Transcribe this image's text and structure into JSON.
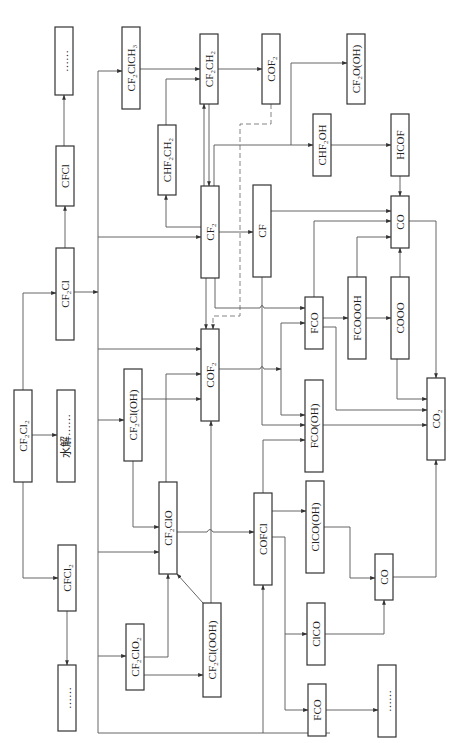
{
  "diagram": {
    "orientation": "rotated-90-ccw",
    "nodes": [
      {
        "id": "CF2Cl2",
        "label": "CF₂Cl₂",
        "x": 14,
        "y": 390,
        "w": 18,
        "h": 92
      },
      {
        "id": "hydrolysis",
        "label": "水解……",
        "x": 57,
        "y": 390,
        "w": 18,
        "h": 92
      },
      {
        "id": "CF2Cl",
        "label": "CF₂Cl",
        "x": 56,
        "y": 248,
        "w": 18,
        "h": 92
      },
      {
        "id": "CFCl",
        "label": "CFCl",
        "x": 56,
        "y": 146,
        "w": 18,
        "h": 60
      },
      {
        "id": "dots1",
        "label": "……",
        "x": 55,
        "y": 27,
        "w": 18,
        "h": 68
      },
      {
        "id": "CFCl2",
        "label": "CFCl₂",
        "x": 58,
        "y": 545,
        "w": 18,
        "h": 66
      },
      {
        "id": "dots2",
        "label": "……",
        "x": 58,
        "y": 665,
        "w": 18,
        "h": 66
      },
      {
        "id": "CF2ClCH3",
        "label": "CF₂ClCH₃",
        "x": 122,
        "y": 27,
        "w": 18,
        "h": 82
      },
      {
        "id": "CHF2CH2",
        "label": "CHF₂CH₂",
        "x": 158,
        "y": 125,
        "w": 18,
        "h": 70
      },
      {
        "id": "CF2CH2",
        "label": "CF₂CH₂",
        "x": 200,
        "y": 34,
        "w": 18,
        "h": 70
      },
      {
        "id": "COF2_top",
        "label": "COF₂",
        "x": 262,
        "y": 34,
        "w": 18,
        "h": 70
      },
      {
        "id": "CF2OOH",
        "label": "CF₂O(OH)",
        "x": 347,
        "y": 34,
        "w": 18,
        "h": 70
      },
      {
        "id": "CHF2OH",
        "label": "CHF₂OH",
        "x": 313,
        "y": 114,
        "w": 18,
        "h": 62
      },
      {
        "id": "HCOF",
        "label": "HCOF",
        "x": 391,
        "y": 114,
        "w": 18,
        "h": 62
      },
      {
        "id": "CF2",
        "label": "CF₂",
        "x": 201,
        "y": 186,
        "w": 18,
        "h": 92
      },
      {
        "id": "CF",
        "label": "CF",
        "x": 253,
        "y": 185,
        "w": 18,
        "h": 92
      },
      {
        "id": "CO_top",
        "label": "CO",
        "x": 391,
        "y": 196,
        "w": 18,
        "h": 52
      },
      {
        "id": "COF2",
        "label": "COF₂",
        "x": 201,
        "y": 329,
        "w": 18,
        "h": 92
      },
      {
        "id": "FCO",
        "label": "FCO",
        "x": 305,
        "y": 297,
        "w": 18,
        "h": 52
      },
      {
        "id": "FCOOOH",
        "label": "FCOOOH",
        "x": 348,
        "y": 277,
        "w": 18,
        "h": 82
      },
      {
        "id": "COOO",
        "label": "COOO",
        "x": 391,
        "y": 277,
        "w": 18,
        "h": 82
      },
      {
        "id": "FCOOH",
        "label": "FCO(OH)",
        "x": 305,
        "y": 380,
        "w": 18,
        "h": 92
      },
      {
        "id": "CO2",
        "label": "CO₂",
        "x": 427,
        "y": 378,
        "w": 18,
        "h": 82
      },
      {
        "id": "CF2ClOH",
        "label": "CF₂Cl(OH)",
        "x": 124,
        "y": 369,
        "w": 18,
        "h": 92
      },
      {
        "id": "CF2ClO",
        "label": "CF₂ClO",
        "x": 159,
        "y": 482,
        "w": 18,
        "h": 92
      },
      {
        "id": "COFCl",
        "label": "COFCl",
        "x": 254,
        "y": 493,
        "w": 18,
        "h": 92
      },
      {
        "id": "ClCOOH",
        "label": "ClCO(OH)",
        "x": 306,
        "y": 481,
        "w": 18,
        "h": 92
      },
      {
        "id": "CO_bot",
        "label": "CO",
        "x": 375,
        "y": 554,
        "w": 18,
        "h": 46
      },
      {
        "id": "ClCO",
        "label": "ClCO",
        "x": 307,
        "y": 603,
        "w": 18,
        "h": 62
      },
      {
        "id": "FCO_bot",
        "label": "FCO",
        "x": 308,
        "y": 684,
        "w": 18,
        "h": 52
      },
      {
        "id": "dots3",
        "label": "……",
        "x": 378,
        "y": 665,
        "w": 18,
        "h": 72
      },
      {
        "id": "CF2ClO2",
        "label": "CF₂ClO₂",
        "x": 126,
        "y": 624,
        "w": 18,
        "h": 66
      },
      {
        "id": "CF2ClOOH",
        "label": "CF₂Cl(OOH)",
        "x": 203,
        "y": 603,
        "w": 18,
        "h": 94
      }
    ]
  }
}
